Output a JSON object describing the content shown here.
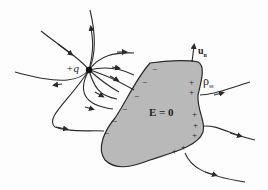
{
  "diagram": {
    "charge_label": "+q",
    "field_inside_label": "E = 0",
    "normal_label": "u",
    "normal_subscript": "n",
    "surface_charge_label": "ρ",
    "surface_charge_subscript": "ss",
    "colors": {
      "conductor_fill": "#b9b9b9",
      "line": "#2a2a2a",
      "background": "#fdfdfd"
    },
    "negative_charges": [
      "−",
      "−",
      "−",
      "−",
      "−",
      "−",
      "−",
      "−"
    ],
    "positive_charges": [
      "+",
      "+",
      "+",
      "+",
      "+",
      "+",
      "+",
      "+",
      "+"
    ]
  }
}
